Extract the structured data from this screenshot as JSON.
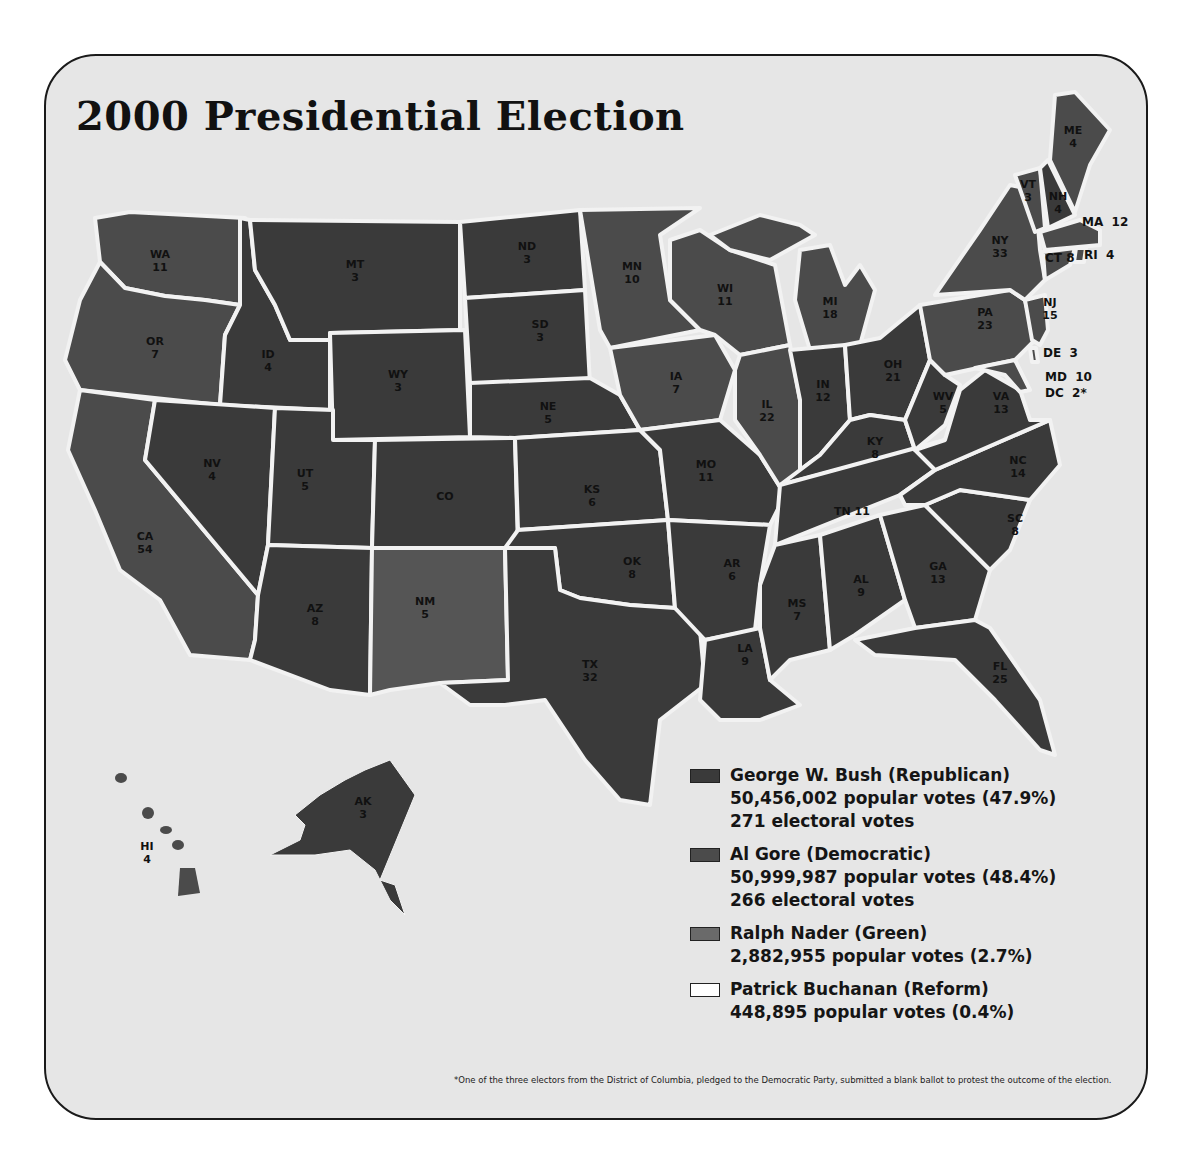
{
  "title": "2000 Presidential Election",
  "colors": {
    "background": "#e6e6e6",
    "republican": "#3a3a3a",
    "democratic": "#4b4b4b",
    "green": "#6a6a6a",
    "reform": "#ffffff",
    "border": "#f2f2f2"
  },
  "legend": [
    {
      "party": "republican",
      "name": "George W. Bush (Republican)",
      "popular": "50,456,002 popular votes (47.9%)",
      "electoral": "271 electoral votes"
    },
    {
      "party": "democratic",
      "name": "Al Gore (Democratic)",
      "popular": "50,999,987 popular votes (48.4%)",
      "electoral": "266 electoral votes"
    },
    {
      "party": "green",
      "name": "Ralph Nader (Green)",
      "popular": "2,882,955 popular votes (2.7%)"
    },
    {
      "party": "reform",
      "name": "Patrick Buchanan (Reform)",
      "popular": "448,895 popular votes (0.4%)"
    }
  ],
  "footnote": "*One of the three electors from the District of Columbia, pledged to the Democratic Party, submitted a blank ballot to protest the outcome of the election.",
  "states": {
    "WA": {
      "abbr": "WA",
      "ev": "11",
      "winner": "D"
    },
    "OR": {
      "abbr": "OR",
      "ev": "7",
      "winner": "D"
    },
    "CA": {
      "abbr": "CA",
      "ev": "54",
      "winner": "D"
    },
    "ID": {
      "abbr": "ID",
      "ev": "4",
      "winner": "R"
    },
    "NV": {
      "abbr": "NV",
      "ev": "4",
      "winner": "R"
    },
    "MT": {
      "abbr": "MT",
      "ev": "3",
      "winner": "R"
    },
    "WY": {
      "abbr": "WY",
      "ev": "3",
      "winner": "R"
    },
    "UT": {
      "abbr": "UT",
      "ev": "5",
      "winner": "R"
    },
    "CO": {
      "abbr": "CO",
      "ev": "",
      "winner": "R"
    },
    "AZ": {
      "abbr": "AZ",
      "ev": "8",
      "winner": "R"
    },
    "NM": {
      "abbr": "NM",
      "ev": "5",
      "winner": "D"
    },
    "ND": {
      "abbr": "ND",
      "ev": "3",
      "winner": "R"
    },
    "SD": {
      "abbr": "SD",
      "ev": "3",
      "winner": "R"
    },
    "NE": {
      "abbr": "NE",
      "ev": "5",
      "winner": "R"
    },
    "KS": {
      "abbr": "KS",
      "ev": "6",
      "winner": "R"
    },
    "OK": {
      "abbr": "OK",
      "ev": "8",
      "winner": "R"
    },
    "TX": {
      "abbr": "TX",
      "ev": "32",
      "winner": "R"
    },
    "MN": {
      "abbr": "MN",
      "ev": "10",
      "winner": "D"
    },
    "IA": {
      "abbr": "IA",
      "ev": "7",
      "winner": "D"
    },
    "MO": {
      "abbr": "MO",
      "ev": "11",
      "winner": "R"
    },
    "AR": {
      "abbr": "AR",
      "ev": "6",
      "winner": "R"
    },
    "LA": {
      "abbr": "LA",
      "ev": "9",
      "winner": "R"
    },
    "WI": {
      "abbr": "WI",
      "ev": "11",
      "winner": "D"
    },
    "IL": {
      "abbr": "IL",
      "ev": "22",
      "winner": "D"
    },
    "MI": {
      "abbr": "MI",
      "ev": "18",
      "winner": "D"
    },
    "IN": {
      "abbr": "IN",
      "ev": "12",
      "winner": "R"
    },
    "OH": {
      "abbr": "OH",
      "ev": "21",
      "winner": "R"
    },
    "KY": {
      "abbr": "KY",
      "ev": "8",
      "winner": "R"
    },
    "TN": {
      "abbr": "TN",
      "ev": "11",
      "winner": "R"
    },
    "MS": {
      "abbr": "MS",
      "ev": "7",
      "winner": "R"
    },
    "AL": {
      "abbr": "AL",
      "ev": "9",
      "winner": "R"
    },
    "GA": {
      "abbr": "GA",
      "ev": "13",
      "winner": "R"
    },
    "FL": {
      "abbr": "FL",
      "ev": "25",
      "winner": "R"
    },
    "SC": {
      "abbr": "SC",
      "ev": "8",
      "winner": "R"
    },
    "NC": {
      "abbr": "NC",
      "ev": "14",
      "winner": "R"
    },
    "VA": {
      "abbr": "VA",
      "ev": "13",
      "winner": "R"
    },
    "WV": {
      "abbr": "WV",
      "ev": "5",
      "winner": "R"
    },
    "PA": {
      "abbr": "PA",
      "ev": "23",
      "winner": "D"
    },
    "NY": {
      "abbr": "NY",
      "ev": "33",
      "winner": "D"
    },
    "VT": {
      "abbr": "VT",
      "ev": "3",
      "winner": "D"
    },
    "NH": {
      "abbr": "NH",
      "ev": "4",
      "winner": "R"
    },
    "ME": {
      "abbr": "ME",
      "ev": "4",
      "winner": "D"
    },
    "MA": {
      "label": "MA  12",
      "winner": "D"
    },
    "RI": {
      "label": "RI  4",
      "winner": "D"
    },
    "CT": {
      "label": "CT 8",
      "winner": "D"
    },
    "NJ": {
      "abbr": "NJ",
      "ev": "15",
      "winner": "D"
    },
    "DE": {
      "label": "DE  3",
      "winner": "D"
    },
    "MD": {
      "label": "MD  10",
      "winner": "D"
    },
    "DC": {
      "label": "DC  2*",
      "winner": "D"
    },
    "AK": {
      "abbr": "AK",
      "ev": "3",
      "winner": "R"
    },
    "HI": {
      "abbr": "HI",
      "ev": "4",
      "winner": "D"
    }
  }
}
